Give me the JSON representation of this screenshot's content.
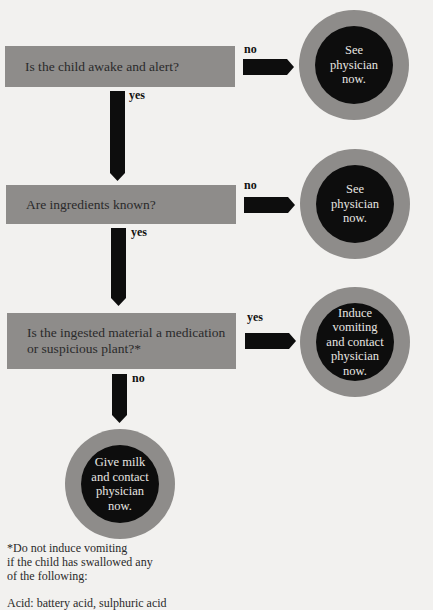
{
  "flowchart": {
    "questions": [
      {
        "text": "Is the child awake and alert?"
      },
      {
        "text": "Are ingredients known?"
      },
      {
        "text": "Is the ingested material a medication or suspicious plant?*"
      }
    ],
    "branch_labels": {
      "q1_right": "no",
      "q1_down": "yes",
      "q2_right": "no",
      "q2_down": "yes",
      "q3_right": "yes",
      "q3_down": "no"
    },
    "outcomes": [
      {
        "lines": [
          "See",
          "physician",
          "now."
        ]
      },
      {
        "lines": [
          "See",
          "physician",
          "now."
        ]
      },
      {
        "lines": [
          "Induce",
          "vomiting",
          "and contact",
          "physician",
          "now."
        ]
      },
      {
        "lines": [
          "Give milk",
          "and contact",
          "physician",
          "now."
        ]
      }
    ]
  },
  "footnote": {
    "lines": [
      "*Do not induce vomiting",
      "if the child has swallowed any",
      "of the following:"
    ],
    "clipped_line": "Acid: battery acid, sulphuric acid"
  },
  "colors": {
    "background": "#f2f1ef",
    "box_gray": "#8e8c8a",
    "arrow_black": "#0d0d0d",
    "circle_inner": "#0d0d0d"
  }
}
